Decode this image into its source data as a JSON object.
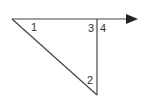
{
  "diagram": {
    "type": "geometry-angles",
    "stroke_color": "#444444",
    "points": {
      "left_vertex": [
        12,
        19
      ],
      "top_right_vertex": [
        97,
        19
      ],
      "bottom_vertex": [
        97,
        95
      ],
      "ray_end": [
        137,
        19
      ]
    },
    "labels": [
      {
        "id": "angle-1",
        "text": "1",
        "x": 31,
        "y": 31
      },
      {
        "id": "angle-3",
        "text": "3",
        "x": 88,
        "y": 32
      },
      {
        "id": "angle-4",
        "text": "4",
        "x": 100,
        "y": 32
      },
      {
        "id": "angle-2",
        "text": "2",
        "x": 87,
        "y": 84
      }
    ]
  }
}
